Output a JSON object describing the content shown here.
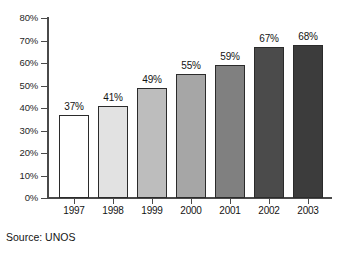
{
  "chart_data": {
    "type": "bar",
    "title": "",
    "subtitle": "",
    "xlabel": "",
    "ylabel": "",
    "categories": [
      "1997",
      "1998",
      "1999",
      "2000",
      "2001",
      "2002",
      "2003"
    ],
    "values": [
      37,
      41,
      49,
      55,
      59,
      67,
      68
    ],
    "value_labels": [
      "37%",
      "41%",
      "49%",
      "55%",
      "59%",
      "67%",
      "68%"
    ],
    "ylim": [
      0,
      80
    ],
    "ytick_values": [
      0,
      10,
      20,
      30,
      40,
      50,
      60,
      70,
      80
    ],
    "ytick_labels": [
      "0%",
      "10%",
      "20%",
      "30%",
      "40%",
      "50%",
      "60%",
      "70%",
      "80%"
    ],
    "grid": false,
    "legend": null,
    "legend_position": "none",
    "bar_colors": [
      "#ffffff",
      "#e2e2e2",
      "#bdbdbd",
      "#a6a6a6",
      "#808080",
      "#4b4b4b",
      "#3c3c3c"
    ],
    "bar_border_color": "#2b2b2b",
    "axis_color": "#4a4a4a",
    "text_color": "#141414",
    "background_color": "#ffffff",
    "annotations": [
      {
        "name": "source-note",
        "text": "Source: UNOS"
      }
    ]
  },
  "footer": {
    "source_text": "Source: UNOS"
  }
}
